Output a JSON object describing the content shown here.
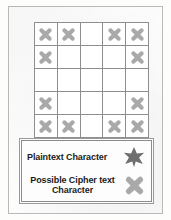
{
  "figure": {
    "colors": {
      "frame_border": "#b9b9b9",
      "grid_border": "#8e8e8e",
      "cell_background": "#ffffff",
      "cipher_mark": "#a9a9a9",
      "plaintext_mark": "#6f6f6f",
      "legend_border": "#8c8c8c",
      "text": "#1b1b1b",
      "page_background": "#fefefe"
    }
  },
  "grid": {
    "rows": 5,
    "columns": 5,
    "cell_mark_icon": "cipher-x-burst-icon",
    "cells": [
      [
        1,
        1,
        0,
        1,
        1
      ],
      [
        1,
        0,
        0,
        0,
        1
      ],
      [
        0,
        0,
        0,
        0,
        0
      ],
      [
        1,
        0,
        0,
        0,
        1
      ],
      [
        1,
        1,
        0,
        1,
        1
      ]
    ]
  },
  "legend": {
    "entries": [
      {
        "label": "Plaintext Character",
        "symbol": "six-pointed-star",
        "symbol_color": "#6f6f6f",
        "lines": [
          "Plaintext Character"
        ]
      },
      {
        "label": "Possible Cipher text Character",
        "symbol": "x-burst",
        "symbol_color": "#a9a9a9",
        "lines": [
          "Possible Cipher text",
          "Character"
        ]
      }
    ]
  }
}
